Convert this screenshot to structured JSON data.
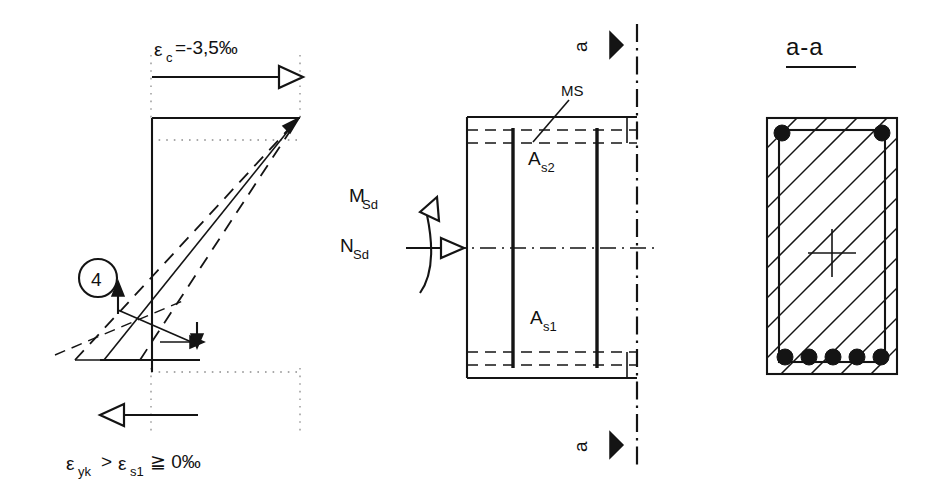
{
  "strain_diagram": {
    "top_label": "ε",
    "top_label_sub": "c",
    "top_label_rest": "=-3,5‰",
    "top_label_full": "εc=-3,5‰",
    "bottom_label_1": "ε",
    "bottom_label_1_sub": "yk",
    "bottom_label_mid": ">",
    "bottom_label_2": "ε",
    "bottom_label_2_sub": "s1",
    "bottom_label_rest": "≧ 0‰",
    "bottom_label_full": "εyk > εs1 ≧ 0‰",
    "zone_marker": "4",
    "zone_marker_name": "strain-zone-4"
  },
  "elevation": {
    "stirrup_label": "MS",
    "top_steel_label": "A",
    "top_steel_sub": "s2",
    "bottom_steel_label": "A",
    "bottom_steel_sub": "s1",
    "moment_label": "M",
    "moment_sub": "Sd",
    "normal_force_label": "N",
    "normal_force_sub": "Sd",
    "section_mark_top": "a",
    "section_mark_bottom": "a"
  },
  "cross_section": {
    "title": "a-a",
    "top_bars_count": 2,
    "bottom_bars_count": 5
  },
  "colors": {
    "ink": "#141414",
    "guide": "#8d8d8d",
    "paper": "#ffffff"
  }
}
